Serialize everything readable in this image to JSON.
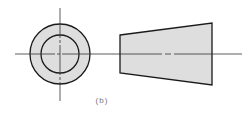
{
  "figure": {
    "caption": "(b)",
    "views": [
      {
        "name": "end-view",
        "description": "concentric circles (annular end view) with center lines"
      },
      {
        "name": "side-view",
        "description": "tapered trapezoid (frustum side view) with axis center line"
      }
    ],
    "colors": {
      "fill": "#dedede",
      "outline": "#1a1a1a",
      "centerline": "#333333",
      "background": "#ffffff"
    }
  }
}
